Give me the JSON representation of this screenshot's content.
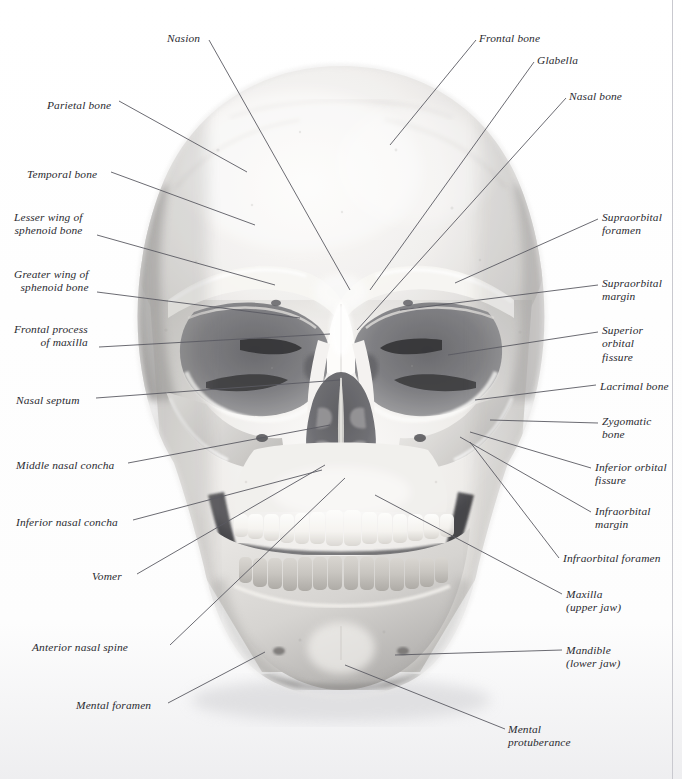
{
  "figure": {
    "view": "anterior (frontal)",
    "image_type": "grayscale photograph with leader-line annotations",
    "background_color": "#ffffff",
    "leader_line_color": "#5a5a62",
    "label_text_color": "#2a2a30"
  },
  "labels": [
    {
      "id": "parietal-bone",
      "text": "Parietal bone",
      "side": "left",
      "x": 47,
      "y": 99
    },
    {
      "id": "nasion",
      "text": "Nasion",
      "side": "left",
      "x": 167,
      "y": 32
    },
    {
      "id": "temporal-bone",
      "text": "Temporal bone",
      "side": "left",
      "x": 27,
      "y": 168
    },
    {
      "id": "lesser-wing-sphenoid",
      "text": "Lesser wing of\nsphenoid bone",
      "side": "left",
      "x": 14,
      "y": 211
    },
    {
      "id": "greater-wing-sphenoid",
      "text": "Greater wing of\nsphenoid bone",
      "side": "left",
      "x": 14,
      "y": 268
    },
    {
      "id": "frontal-process-maxilla",
      "text": "Frontal process\nof maxilla",
      "side": "left",
      "x": 14,
      "y": 323
    },
    {
      "id": "nasal-septum",
      "text": "Nasal septum",
      "side": "left",
      "x": 16,
      "y": 394
    },
    {
      "id": "middle-nasal-concha",
      "text": "Middle nasal concha",
      "side": "left",
      "x": 16,
      "y": 459
    },
    {
      "id": "inferior-nasal-concha",
      "text": "Inferior nasal concha",
      "side": "left",
      "x": 16,
      "y": 516
    },
    {
      "id": "vomer",
      "text": "Vomer",
      "side": "left",
      "x": 92,
      "y": 570
    },
    {
      "id": "anterior-nasal-spine",
      "text": "Anterior nasal spine",
      "side": "left",
      "x": 32,
      "y": 641
    },
    {
      "id": "mental-foramen",
      "text": "Mental foramen",
      "side": "left",
      "x": 76,
      "y": 699
    },
    {
      "id": "frontal-bone",
      "text": "Frontal bone",
      "side": "right",
      "x": 479,
      "y": 32
    },
    {
      "id": "glabella",
      "text": "Glabella",
      "side": "right",
      "x": 537,
      "y": 54
    },
    {
      "id": "nasal-bone",
      "text": "Nasal bone",
      "side": "right",
      "x": 569,
      "y": 90
    },
    {
      "id": "supraorbital-foramen",
      "text": "Supraorbital\nforamen",
      "side": "right",
      "x": 602,
      "y": 211
    },
    {
      "id": "supraorbital-margin",
      "text": "Supraorbital\nmargin",
      "side": "right",
      "x": 602,
      "y": 277
    },
    {
      "id": "superior-orbital-fissure",
      "text": "Superior\norbital\nfissure",
      "side": "right",
      "x": 602,
      "y": 324
    },
    {
      "id": "lacrimal-bone",
      "text": "Lacrimal bone",
      "side": "right",
      "x": 600,
      "y": 380
    },
    {
      "id": "zygomatic-bone",
      "text": "Zygomatic\nbone",
      "side": "right",
      "x": 602,
      "y": 415
    },
    {
      "id": "inferior-orbital-fissure",
      "text": "Inferior orbital\nfissure",
      "side": "right",
      "x": 595,
      "y": 461
    },
    {
      "id": "infraorbital-margin",
      "text": "Infraorbital\nmargin",
      "side": "right",
      "x": 595,
      "y": 505
    },
    {
      "id": "infraorbital-foramen",
      "text": "Infraorbital foramen",
      "side": "right",
      "x": 563,
      "y": 552
    },
    {
      "id": "maxilla",
      "text": "Maxilla\n(upper jaw)",
      "side": "right",
      "x": 566,
      "y": 588
    },
    {
      "id": "mandible",
      "text": "Mandible\n(lower jaw)",
      "side": "right",
      "x": 566,
      "y": 644
    },
    {
      "id": "mental-protuberance",
      "text": "Mental\nprotuberance",
      "side": "right",
      "x": 508,
      "y": 723
    }
  ],
  "leaders": [
    {
      "id": "leader-nasion",
      "points": "209,40 350,290"
    },
    {
      "id": "leader-parietal-bone",
      "points": "119,101 247,172"
    },
    {
      "id": "leader-temporal-bone",
      "points": "111,172 255,225"
    },
    {
      "id": "leader-lesser-wing",
      "points": "97,235 275,285"
    },
    {
      "id": "leader-greater-wing",
      "points": "97,292 300,318"
    },
    {
      "id": "leader-frontal-process",
      "points": "99,347 330,334"
    },
    {
      "id": "leader-nasal-septum",
      "points": "96,398 340,380"
    },
    {
      "id": "leader-middle-nasal-concha",
      "points": "128,463 330,425"
    },
    {
      "id": "leader-inferior-nasal-concha",
      "points": "133,520 322,470"
    },
    {
      "id": "leader-vomer",
      "points": "137,574 325,465"
    },
    {
      "id": "leader-anterior-nasal-spine",
      "points": "170,645 345,478"
    },
    {
      "id": "leader-mental-foramen",
      "points": "168,703 265,652"
    },
    {
      "id": "leader-frontal-bone",
      "points": "476,40 390,145"
    },
    {
      "id": "leader-glabella",
      "points": "534,62 370,290"
    },
    {
      "id": "leader-nasal-bone",
      "points": "566,98 357,330"
    },
    {
      "id": "leader-supraorbital-foramen",
      "points": "598,219 455,283"
    },
    {
      "id": "leader-supraorbital-margin",
      "points": "598,285 400,310"
    },
    {
      "id": "leader-superior-orbital-fissure",
      "points": "598,332 448,355"
    },
    {
      "id": "leader-lacrimal-bone",
      "points": "596,385 475,400"
    },
    {
      "id": "leader-zygomatic-bone",
      "points": "598,423 490,420"
    },
    {
      "id": "leader-inferior-orbital-fissure",
      "points": "591,468 470,432"
    },
    {
      "id": "leader-infraorbital-margin",
      "points": "591,512 460,437"
    },
    {
      "id": "leader-infraorbital-foramen",
      "points": "559,558 470,442"
    },
    {
      "id": "leader-maxilla",
      "points": "562,594 375,495"
    },
    {
      "id": "leader-mandible",
      "points": "562,650 395,655"
    },
    {
      "id": "leader-mental-protuberance",
      "points": "505,729 345,665"
    }
  ]
}
